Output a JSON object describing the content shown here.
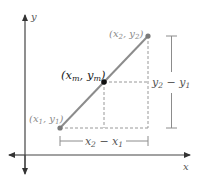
{
  "diagram": {
    "axes": {
      "x_label": "x",
      "y_label": "y"
    },
    "points": {
      "p1": {
        "label_open": "(x",
        "label_sub1": "1",
        "label_sep": ", y",
        "label_sub2": "1",
        "label_close": ")"
      },
      "p2": {
        "label_open": "(x",
        "label_sub1": "2",
        "label_sep": ", y",
        "label_sub2": "2",
        "label_close": ")"
      },
      "midpoint": {
        "label_open": "(x",
        "label_sub1": "m",
        "label_sep": ", y",
        "label_sub2": "m",
        "label_close": ")"
      }
    },
    "brackets": {
      "horizontal": {
        "a": "x",
        "a_sub": "2",
        "minus": " − ",
        "b": "x",
        "b_sub": "1"
      },
      "vertical": {
        "a": "y",
        "a_sub": "2",
        "minus": " − ",
        "b": "y",
        "b_sub": "1"
      }
    },
    "colors": {
      "axis": "#333333",
      "segment": "#8c8c8c",
      "endpoint": "#8c8c8c",
      "midpoint": "#111111",
      "dashed": "#8c8c8c",
      "bracket": "#8c8c8c"
    }
  }
}
